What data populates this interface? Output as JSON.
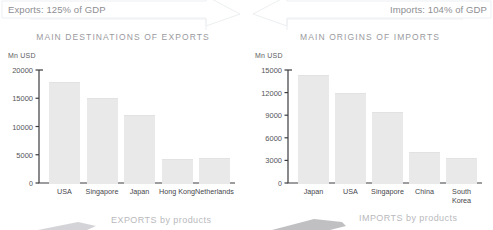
{
  "banner": {
    "exports_label": "Exports: 125% of GDP",
    "imports_label": "Imports: 104% of GDP"
  },
  "bottom": {
    "exports_products": "EXPORTS by products",
    "imports_products": "IMPORTS by products"
  },
  "colors": {
    "bar_fill": "#e9e9e9",
    "axis": "#3c3c40",
    "title_text": "#9a9a9e",
    "banner_text": "#8e8e92",
    "bottom_text": "#b9b9bd"
  },
  "chart_data": [
    {
      "type": "bar",
      "title": "MAIN DESTINATIONS OF EXPORTS",
      "ylabel": "Mn USD",
      "xlabel": "",
      "categories": [
        "USA",
        "Singapore",
        "Japan",
        "Hong Kong",
        "Netherlands"
      ],
      "values": [
        17800,
        15100,
        12100,
        4300,
        4350
      ],
      "yticks": [
        "0",
        "5000",
        "10000",
        "15000",
        "20000"
      ],
      "ytick_values": [
        0,
        5000,
        10000,
        15000,
        20000
      ],
      "ylim": [
        0,
        20000
      ],
      "grid": false,
      "legend": false
    },
    {
      "type": "bar",
      "title": "MAIN ORIGINS OF IMPORTS",
      "ylabel": "Mn USD",
      "xlabel": "",
      "categories": [
        "Japan",
        "USA",
        "Singapore",
        "China",
        "South\nKorea"
      ],
      "values": [
        14300,
        11950,
        9400,
        4100,
        3300
      ],
      "yticks": [
        "0",
        "3000",
        "6000",
        "9000",
        "12000",
        "15000"
      ],
      "ytick_values": [
        0,
        3000,
        6000,
        9000,
        12000,
        15000
      ],
      "ylim": [
        0,
        15000
      ],
      "grid": false,
      "legend": false
    }
  ]
}
